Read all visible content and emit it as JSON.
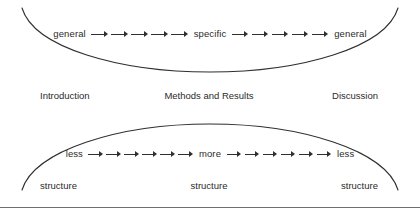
{
  "figure": {
    "line_color": "#2f2f2f",
    "text_color": "#2b2b2b",
    "background": "#ffffff",
    "rule_color": "#6f6f6f"
  },
  "bands": {
    "top": {
      "curve_shape": "concave-up-arc",
      "flow": {
        "start_label": "general",
        "middle_label": "specific",
        "end_label": "general",
        "arrows_before_middle": 5,
        "arrows_after_middle": 5,
        "arrow_glyph": "right-arrow"
      },
      "captions": {
        "left": "Introduction",
        "center": "Methods and Results",
        "right": "Discussion"
      }
    },
    "bottom": {
      "curve_shape": "convex-up-arc",
      "flow": {
        "start_label": "less",
        "middle_label": "more",
        "end_label": "less",
        "arrows_before_middle": 6,
        "arrows_after_middle": 6,
        "arrow_glyph": "right-arrow"
      },
      "captions": {
        "left": "structure",
        "center": "structure",
        "right": "structure"
      }
    }
  }
}
